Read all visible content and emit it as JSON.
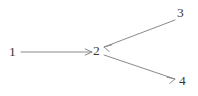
{
  "figure": {
    "kind": "directed-graph",
    "width": 198,
    "height": 96,
    "background_color": "#ffffff",
    "edge_color": "#8a8a8a",
    "label_color": "#3a3a3a"
  },
  "nodes": [
    {
      "id": "1",
      "label": "1",
      "x": 13,
      "y": 52
    },
    {
      "id": "2",
      "label": "2",
      "x": 97,
      "y": 51
    },
    {
      "id": "3",
      "label": "3",
      "x": 181,
      "y": 13
    },
    {
      "id": "4",
      "label": "4",
      "x": 183,
      "y": 81
    }
  ],
  "edges": [
    {
      "id": "e1",
      "from": "1",
      "to": "2",
      "x1": 21,
      "y1": 52,
      "x2": 92,
      "y2": 52,
      "arrow": "end"
    },
    {
      "id": "e2",
      "from": "3",
      "to": "2",
      "x1": 175,
      "y1": 20,
      "x2": 104,
      "y2": 47,
      "arrow": "end"
    },
    {
      "id": "e3",
      "from": "2",
      "to": "4",
      "x1": 104,
      "y1": 55,
      "x2": 175,
      "y2": 79,
      "arrow": "end"
    }
  ]
}
